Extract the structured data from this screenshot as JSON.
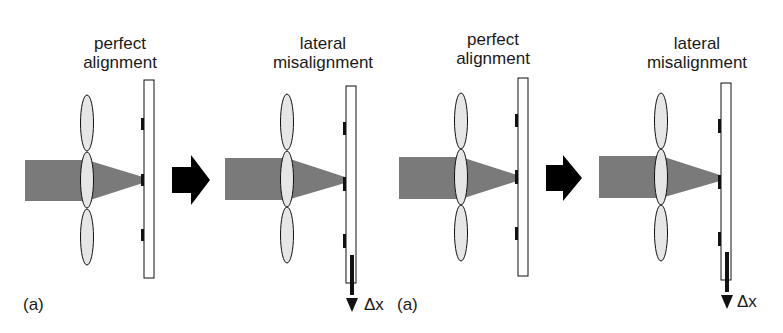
{
  "diagram": {
    "panels": [
      {
        "id": "p1",
        "title_line1": "perfect",
        "title_line2": "alignment",
        "state": "aligned"
      },
      {
        "id": "p2",
        "title_line1": "lateral",
        "title_line2": "misalignment",
        "state": "shifted",
        "shift_label": "Δx"
      },
      {
        "id": "p3",
        "title_line1": "perfect",
        "title_line2": "alignment",
        "state": "aligned"
      },
      {
        "id": "p4",
        "title_line1": "lateral",
        "title_line2": "misalignment",
        "state": "shifted",
        "shift_label": "Δx"
      }
    ],
    "panel_tags": [
      "(a)",
      "(a)"
    ],
    "transition_arrows": [
      "right-arrow",
      "right-arrow"
    ],
    "colors": {
      "beam": "#7a7a7a",
      "lens_fill": "#e6e6e6",
      "outline": "#111111",
      "mark": "#111111",
      "arrow": "#000000",
      "background": "#ffffff"
    }
  }
}
